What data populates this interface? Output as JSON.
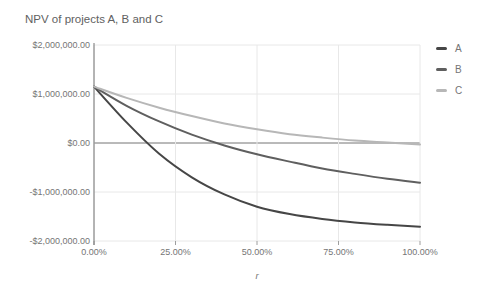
{
  "chart_data": {
    "type": "line",
    "title": "NPV of projects A, B and C",
    "xlabel": "r",
    "ylabel": "",
    "x": [
      0,
      10,
      20,
      30,
      40,
      50,
      60,
      70,
      80,
      90,
      100
    ],
    "x_unit": "percent",
    "xlim": [
      0,
      100
    ],
    "ylim": [
      -2000000,
      2000000
    ],
    "grid": true,
    "legend_position": "right",
    "series": [
      {
        "name": "A",
        "color": "#464646",
        "values": [
          1150000,
          420000,
          -220000,
          -700000,
          -1050000,
          -1300000,
          -1450000,
          -1550000,
          -1620000,
          -1670000,
          -1710000
        ]
      },
      {
        "name": "B",
        "color": "#5f5f5f",
        "values": [
          1150000,
          760000,
          440000,
          170000,
          -50000,
          -230000,
          -380000,
          -520000,
          -630000,
          -730000,
          -810000
        ]
      },
      {
        "name": "C",
        "color": "#b7b7b7",
        "values": [
          1150000,
          920000,
          720000,
          550000,
          400000,
          280000,
          180000,
          110000,
          50000,
          10000,
          -30000
        ]
      }
    ],
    "y_tick_labels": [
      "$2,000,000.00",
      "$1,000,000.00",
      "$0.00",
      "-$1,000,000.00",
      "-$2,000,000.00"
    ],
    "x_tick_labels": [
      "0.00%",
      "25.00%",
      "50.00%",
      "75.00%",
      "100.00%"
    ]
  },
  "colors": {
    "background": "#ffffff",
    "title_text": "#616161",
    "tick_text": "#757575",
    "grid": "#e8e8e8",
    "zero_line": "#757575",
    "axis_line": "#757575",
    "tick_mark": "#9e9e9e"
  }
}
